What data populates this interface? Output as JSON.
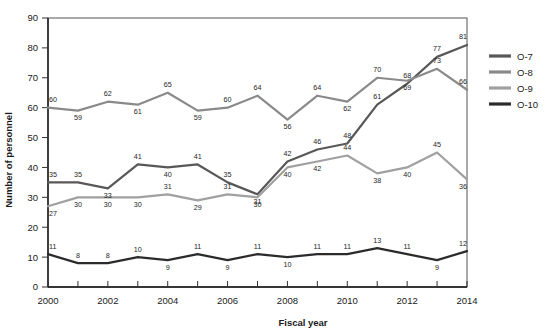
{
  "chart_data": {
    "type": "line",
    "title": "",
    "xlabel": "Fiscal year",
    "ylabel": "Number of personnel",
    "categories": [
      2000,
      2001,
      2002,
      2003,
      2004,
      2005,
      2006,
      2007,
      2008,
      2009,
      2010,
      2011,
      2012,
      2013,
      2014
    ],
    "x_tick_labels": [
      "2000",
      "",
      "2002",
      "",
      "2004",
      "",
      "2006",
      "",
      "2008",
      "",
      "2010",
      "",
      "2012",
      "",
      "2014"
    ],
    "y_tick_labels": [
      "0",
      "10",
      "20",
      "30",
      "40",
      "50",
      "60",
      "70",
      "80",
      "90"
    ],
    "y_ticks": [
      0,
      10,
      20,
      30,
      40,
      50,
      60,
      70,
      80,
      90
    ],
    "ylim": [
      0,
      90
    ],
    "xlim": [
      2000,
      2014
    ],
    "grid": false,
    "legend_position": "right",
    "series": [
      {
        "name": "O-7",
        "color": "#585858",
        "values": [
          35,
          35,
          33,
          41,
          40,
          41,
          35,
          31,
          42,
          46,
          48,
          61,
          68,
          77,
          81
        ],
        "labels": [
          "35",
          "35",
          "33",
          "41",
          "40",
          "41",
          "35",
          "31",
          "42",
          "46",
          "48",
          "61",
          "68",
          "77",
          "81"
        ]
      },
      {
        "name": "O-8",
        "color": "#8a8a8a",
        "values": [
          60,
          59,
          62,
          61,
          65,
          59,
          60,
          64,
          56,
          64,
          62,
          70,
          69,
          73,
          66
        ],
        "labels": [
          "60",
          "59",
          "62",
          "61",
          "65",
          "59",
          "60",
          "64",
          "56",
          "64",
          "62",
          "70",
          "69",
          "73",
          "66"
        ]
      },
      {
        "name": "O-9",
        "color": "#a0a0a0",
        "values": [
          27,
          30,
          30,
          30,
          31,
          29,
          31,
          30,
          40,
          42,
          44,
          38,
          40,
          45,
          36
        ],
        "labels": [
          "27",
          "30",
          "30",
          "30",
          "31",
          "29",
          "31",
          "30",
          "40",
          "42",
          "44",
          "38",
          "40",
          "45",
          "36"
        ]
      },
      {
        "name": "O-10",
        "color": "#2b2b2b",
        "values": [
          11,
          8,
          8,
          10,
          9,
          11,
          9,
          11,
          10,
          11,
          11,
          13,
          11,
          9,
          12
        ],
        "labels": [
          "11",
          "8",
          "8",
          "10",
          "9",
          "11",
          "9",
          "11",
          "10",
          "11",
          "11",
          "13",
          "11",
          "9",
          "12"
        ]
      }
    ]
  },
  "legend": {
    "items": [
      {
        "label": "O-7",
        "color": "#585858"
      },
      {
        "label": "O-8",
        "color": "#8a8a8a"
      },
      {
        "label": "O-9",
        "color": "#a0a0a0"
      },
      {
        "label": "O-10",
        "color": "#2b2b2b"
      }
    ]
  }
}
